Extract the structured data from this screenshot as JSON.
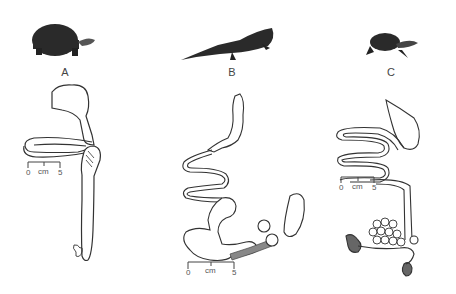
{
  "panels": [
    {
      "id": "A",
      "label": "A",
      "animal": "tortoise",
      "scale_bar": {
        "start": "0",
        "unit": "cm",
        "end": "5"
      }
    },
    {
      "id": "B",
      "label": "B",
      "animal": "iguana",
      "scale_bar": {
        "start": "0",
        "unit": "cm",
        "end": "5"
      }
    },
    {
      "id": "C",
      "label": "C",
      "animal": "turtle",
      "scale_bar": {
        "start": "0",
        "unit": "cm",
        "end": "5"
      }
    }
  ],
  "colors": {
    "line": "#333333",
    "silhouette": "#2a2a2a",
    "organ_fill": "#666666",
    "background": "#ffffff"
  }
}
